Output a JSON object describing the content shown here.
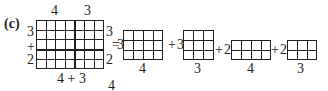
{
  "label": "(c)",
  "big_grid": {
    "top_labels": [
      "4",
      "3"
    ],
    "left_labels": [
      "3",
      "+",
      "2"
    ],
    "right_labels": [
      "3",
      "2"
    ],
    "bottom_label": "4 + 3",
    "cols": 7,
    "rows": 5,
    "split_col": 4,
    "split_row": 3
  },
  "stray_label": "4",
  "equals": "=",
  "terms": [
    {
      "op": "",
      "coef": "3",
      "cols": 4,
      "rows": 3,
      "bottom": "4"
    },
    {
      "op": "+",
      "coef": "3",
      "cols": 3,
      "rows": 3,
      "bottom": "3"
    },
    {
      "op": "+",
      "coef": "2",
      "cols": 4,
      "rows": 2,
      "bottom": "4"
    },
    {
      "op": "+",
      "coef": "2",
      "cols": 3,
      "rows": 2,
      "bottom": "3"
    }
  ],
  "colors": {
    "ink": "#231f20"
  }
}
